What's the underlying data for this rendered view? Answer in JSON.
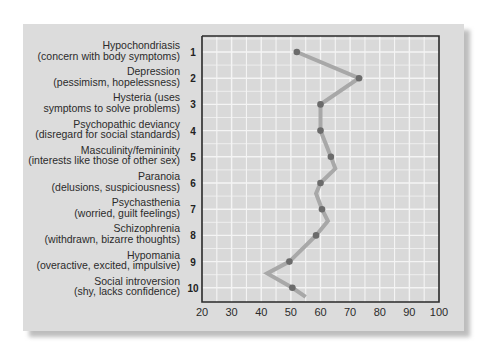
{
  "chart_data": {
    "type": "line",
    "title": "",
    "xlabel": "",
    "ylabel": "",
    "xlim": [
      20,
      100
    ],
    "xticks": [
      20,
      30,
      40,
      50,
      60,
      70,
      80,
      90,
      100
    ],
    "grid": true,
    "categories": [
      {
        "num": "1",
        "name": "Hypochondriasis",
        "desc": "(concern with body symptoms)"
      },
      {
        "num": "2",
        "name": "Depression",
        "desc": "(pessimism, hopelessness)"
      },
      {
        "num": "3",
        "name": "Hysteria (uses",
        "desc": "symptoms to solve problems)"
      },
      {
        "num": "4",
        "name": "Psychopathic deviancy",
        "desc": "(disregard for social standards)"
      },
      {
        "num": "5",
        "name": "Masculinity/femininity",
        "desc": "(interests like those of other sex)"
      },
      {
        "num": "6",
        "name": "Paranoia",
        "desc": "(delusions, suspiciousness)"
      },
      {
        "num": "7",
        "name": "Psychasthenia",
        "desc": "(worried, guilt feelings)"
      },
      {
        "num": "8",
        "name": "Schizophrenia",
        "desc": "(withdrawn, bizarre thoughts)"
      },
      {
        "num": "9",
        "name": "Hypomania",
        "desc": "(overactive, excited, impulsive)"
      },
      {
        "num": "10",
        "name": "Social introversion",
        "desc": "(shy, lacks confidence)"
      }
    ],
    "series": [
      {
        "name": "points",
        "values": [
          52,
          73,
          60,
          60,
          63.5,
          60,
          60.5,
          58.5,
          49.5,
          50.5
        ],
        "color": "#6b6b6b"
      },
      {
        "name": "profile-line",
        "vertices": [
          [
            1,
            52
          ],
          [
            2,
            73
          ],
          [
            3,
            60
          ],
          [
            4,
            60
          ],
          [
            5,
            63.5
          ],
          [
            5.45,
            65
          ],
          [
            6,
            60
          ],
          [
            6.4,
            58.5
          ],
          [
            7,
            60.5
          ],
          [
            7.45,
            62.5
          ],
          [
            8,
            58.5
          ],
          [
            9,
            49.5
          ],
          [
            9.45,
            42
          ],
          [
            10,
            50.5
          ],
          [
            10.35,
            55
          ]
        ],
        "color": "#a8a8a8"
      }
    ],
    "colors": {
      "panel": "#dcdcdc",
      "grid": "#f4f4f4",
      "axis": "#2a2a2a",
      "dot": "#6b6b6b",
      "line": "#a6a6a6"
    }
  }
}
